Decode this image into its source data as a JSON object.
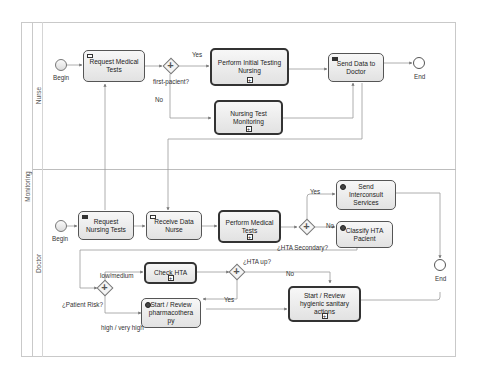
{
  "diagram": {
    "pool": {
      "label": "Monitoring"
    },
    "lanes": [
      {
        "id": "nurse",
        "label": "Nurse"
      },
      {
        "id": "doctor",
        "label": "Doctor"
      }
    ],
    "nurse": {
      "begin_label": "Begin",
      "end_label": "End",
      "tasks": {
        "request_medical_tests": "Request Medical Tests",
        "perform_initial_testing": "Perform Initial Testing Nursing",
        "nursing_test_monitoring": "Nursing Test Monitoring",
        "send_data_to_doctor": "Send Data to Doctor"
      },
      "gateway": {
        "label": "first-pacient?",
        "yes": "Yes",
        "no": "No"
      }
    },
    "doctor": {
      "begin_label": "Begin",
      "end_label": "End",
      "tasks": {
        "request_nursing_tests": "Request Nursing Tests",
        "receive_data_nurse": "Receive Data Nurse",
        "perform_medical_tests": "Perform Medical Tests",
        "send_interconsult": "Send Interconsult Services",
        "classify_hta": "Classify HTA Pacient",
        "check_hta": "Check HTA",
        "start_review_pharma": "Start / Review pharmacothera py",
        "start_review_hygienic": "Start / Review hygienic sanitary actions"
      },
      "gateways": {
        "hta_secondary": {
          "label": "¿HTA Secondary?",
          "yes": "Yes",
          "no": "No"
        },
        "patient_risk": {
          "label": "¿Patient Risk?",
          "low": "low/medium",
          "high": "high / very high"
        },
        "hta_up": {
          "label": "¿HTA up?",
          "yes": "Yes",
          "no": "No"
        }
      }
    },
    "colors": {
      "task_border": "#555555",
      "subprocess_border": "#333333",
      "flow_line": "#9a9a9a",
      "lane_border": "#c9c9c9",
      "task_fill_top": "#f7f7f7",
      "task_fill_bottom": "#e2e2e2"
    }
  }
}
